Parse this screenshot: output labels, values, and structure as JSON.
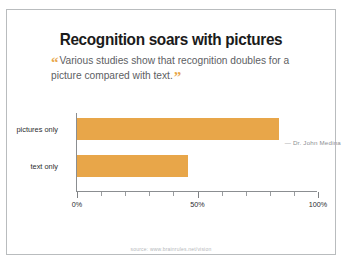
{
  "slide": {
    "title": "Recognition soars with pictures",
    "quote": {
      "open_mark": "“",
      "text": "Various studies show that recognition doubles for a picture compared with text.",
      "close_mark": "”",
      "attribution": "— Dr. John Medina"
    },
    "source": "source: www.brainrules.net/vision",
    "accent_color": "#E8A649",
    "border_color": "#b9bcbe",
    "text_color": "#2a2c2e"
  },
  "chart_data": {
    "type": "bar",
    "orientation": "horizontal",
    "title": "Recognition soars with pictures",
    "categories": [
      "pictures only",
      "text only"
    ],
    "values": [
      84,
      46
    ],
    "xlabel": "",
    "ylabel": "",
    "xlim": [
      0,
      100
    ],
    "grid": false,
    "legend": "none",
    "bar_color": "#E8A649",
    "tick_labels": [
      "0%",
      "50%",
      "100%"
    ],
    "tick_values": [
      0,
      50,
      100
    ],
    "minor_tick_values": [
      10,
      20,
      30,
      40,
      60,
      70,
      80,
      90
    ]
  }
}
